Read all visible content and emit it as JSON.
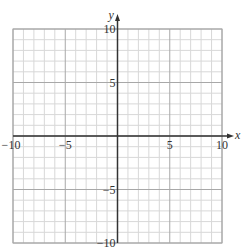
{
  "chart_data": {
    "type": "scatter",
    "title": "",
    "xlabel": "x",
    "ylabel": "y",
    "xlim": [
      -10,
      10
    ],
    "ylim": [
      -10,
      10
    ],
    "grid": true,
    "grid_minor_step": 1,
    "grid_major_step": 5,
    "x_ticks": [
      -10,
      -5,
      5,
      10
    ],
    "x_tick_labels": [
      "−10",
      "−5",
      "5",
      "10"
    ],
    "y_ticks": [
      10,
      5,
      -5,
      -10
    ],
    "y_tick_labels": [
      "10",
      "5",
      "−5",
      "−10"
    ],
    "series": [],
    "legend": null
  },
  "colors": {
    "minor_grid": "#d8d8d8",
    "major_grid": "#a8a8a8",
    "axis": "#333333",
    "label": "#333333"
  },
  "layout": {
    "left": 13,
    "right": 222,
    "top": 29,
    "bottom": 243
  }
}
